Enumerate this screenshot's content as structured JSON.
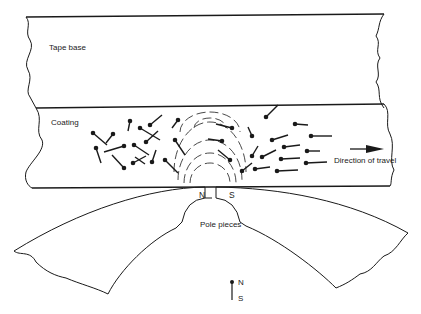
{
  "labels": {
    "tape_base": "Tape base",
    "coating": "Coating",
    "direction": "Direction of travel",
    "pole_pieces": "Pole pieces",
    "head_n": "N",
    "head_s": "S",
    "legend_n": "N",
    "legend_s": "S"
  },
  "colors": {
    "ink": "#1a1a1a",
    "background": "#ffffff"
  }
}
